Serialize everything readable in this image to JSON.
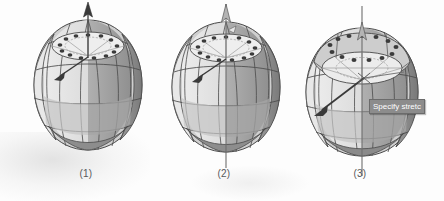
{
  "figure": {
    "type": "technical-illustration",
    "background_color": "#fdfdfd",
    "panels": [
      {
        "id": "panel-1",
        "caption": "(1)",
        "description": "Faceted sphere with vertical axis arrow and diagonal grip arrow",
        "axis_arrow": "up-arrow-solid",
        "drag_arrow": "down-left-arrow-solid",
        "grip_ring_count": 13,
        "top_flattened": false,
        "tooltip": null
      },
      {
        "id": "panel-2",
        "caption": "(2)",
        "description": "Faceted sphere with full-length vertical axis line through the body",
        "axis_arrow": "up-arrow-outline",
        "drag_arrow": "down-left-arrow-solid",
        "grip_ring_count": 13,
        "top_flattened": false,
        "tooltip": null
      },
      {
        "id": "panel-3",
        "caption": "(3)",
        "description": "Faceted sphere with flattened top cap being stretched",
        "axis_arrow": "up-arrow-outline",
        "drag_arrow": "down-left-arrow-solid",
        "grip_ring_count": 13,
        "top_flattened": true,
        "tooltip": "Specify stretc"
      }
    ]
  },
  "colors": {
    "facet_light": "#e3e3e3",
    "facet_mid": "#c9c9c9",
    "facet_dark": "#9b9b9b",
    "facet_darkest": "#7d7d7d",
    "outline": "#4a4a4a",
    "grip_dot": "#3f3f3f",
    "axis_line": "#6e6e6e",
    "caption_text": "#58595b",
    "tooltip_bg": "#8c8c8c",
    "tooltip_text": "#ffffff"
  }
}
